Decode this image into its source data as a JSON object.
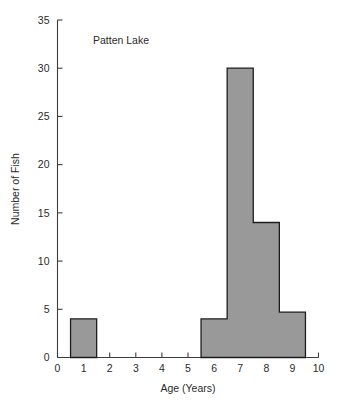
{
  "chart_data": {
    "type": "bar",
    "title": "Patten Lake",
    "xlabel": "Age (Years)",
    "ylabel": "Number of Fish",
    "xlim": [
      0,
      10
    ],
    "ylim": [
      0,
      35
    ],
    "grid": false,
    "legend": null,
    "bin_width": 1,
    "bin_edges": [
      0.5,
      1.5,
      5.5,
      6.5,
      7.5,
      8.5,
      9.5
    ],
    "categories": [
      "0.5-1.5",
      "5.5-6.5",
      "6.5-7.5",
      "7.5-8.5",
      "8.5-9.5"
    ],
    "x": [
      1,
      6,
      7,
      8,
      9
    ],
    "values": [
      4,
      4,
      30,
      14,
      4.7
    ],
    "bars": [
      {
        "start": 0.5,
        "end": 1.5,
        "value": 4
      },
      {
        "start": 5.5,
        "end": 6.5,
        "value": 4
      },
      {
        "start": 6.5,
        "end": 7.5,
        "value": 30
      },
      {
        "start": 7.5,
        "end": 8.5,
        "value": 14
      },
      {
        "start": 8.5,
        "end": 9.5,
        "value": 4.7
      }
    ],
    "xticks": [
      0,
      1,
      2,
      3,
      4,
      5,
      6,
      7,
      8,
      9,
      10
    ],
    "xtick_labels": [
      "0",
      "1",
      "2",
      "3",
      "4",
      "5",
      "6",
      "7",
      "8",
      "9",
      "10"
    ],
    "yticks": [
      0,
      5,
      10,
      15,
      20,
      25,
      30,
      35
    ],
    "ytick_labels": [
      "0",
      "5",
      "10",
      "15",
      "20",
      "25",
      "30",
      "35"
    ],
    "colors": {
      "bar_fill": "#999999",
      "bar_edge": "#1d1d1d",
      "axis": "#3d3d3d",
      "text": "#2b2b2b",
      "background": "#ffffff"
    }
  }
}
